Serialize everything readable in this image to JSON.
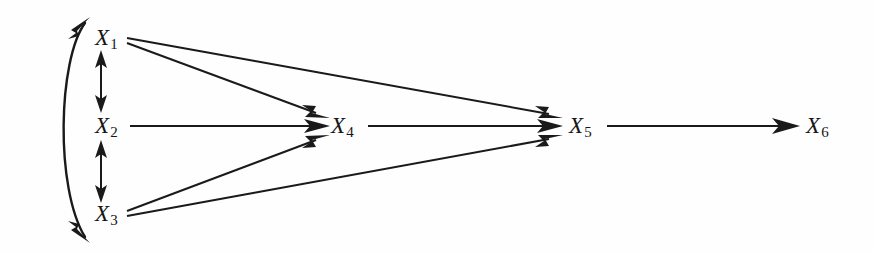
{
  "figure": {
    "type": "path-diagram",
    "width": 874,
    "height": 253,
    "background_color": "#ffffff",
    "line_color": "#1a1a1a",
    "label_color": "#161616"
  },
  "nodes": [
    {
      "id": "X1",
      "name": "X",
      "subscript": "1",
      "x": 110,
      "y": 38
    },
    {
      "id": "X2",
      "name": "X",
      "subscript": "2",
      "x": 110,
      "y": 126
    },
    {
      "id": "X3",
      "name": "X",
      "subscript": "3",
      "x": 110,
      "y": 214
    },
    {
      "id": "X4",
      "name": "X",
      "subscript": "4",
      "x": 345,
      "y": 126
    },
    {
      "id": "X5",
      "name": "X",
      "subscript": "5",
      "x": 583,
      "y": 126
    },
    {
      "id": "X6",
      "name": "X",
      "subscript": "6",
      "x": 820,
      "y": 126
    }
  ],
  "directed_edges": [
    {
      "from": "X1",
      "to": "X4",
      "style": "straight"
    },
    {
      "from": "X1",
      "to": "X5",
      "style": "straight"
    },
    {
      "from": "X2",
      "to": "X4",
      "style": "straight"
    },
    {
      "from": "X3",
      "to": "X4",
      "style": "straight"
    },
    {
      "from": "X3",
      "to": "X5",
      "style": "straight"
    },
    {
      "from": "X4",
      "to": "X5",
      "style": "straight"
    },
    {
      "from": "X5",
      "to": "X6",
      "style": "straight"
    }
  ],
  "correlation_edges": [
    {
      "between": [
        "X1",
        "X2"
      ],
      "style": "straight-double-headed",
      "orientation": "vertical"
    },
    {
      "between": [
        "X2",
        "X3"
      ],
      "style": "straight-double-headed",
      "orientation": "vertical"
    },
    {
      "between": [
        "X1",
        "X3"
      ],
      "style": "curved-double-headed",
      "orientation": "left-arc"
    }
  ],
  "labels": {
    "x1": "X",
    "x1_sub": "1",
    "x2": "X",
    "x2_sub": "2",
    "x3": "X",
    "x3_sub": "3",
    "x4": "X",
    "x4_sub": "4",
    "x5": "X",
    "x5_sub": "5",
    "x6": "X",
    "x6_sub": "6"
  }
}
